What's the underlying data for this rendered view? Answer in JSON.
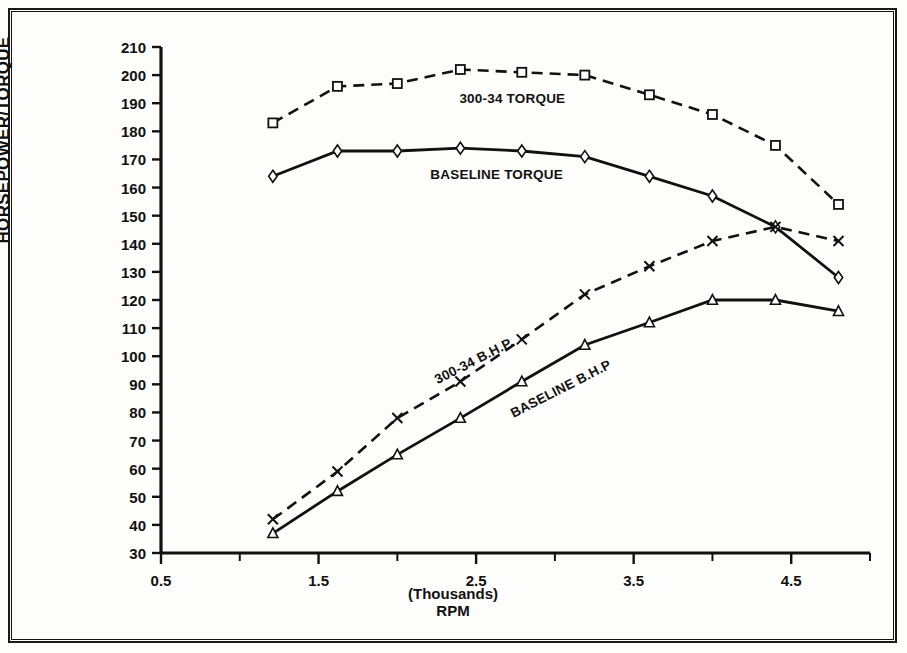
{
  "chart_data": {
    "type": "line",
    "title": "",
    "xlabel": "(Thousands) RPM",
    "ylabel": "HORSEPOWER/TORQUE",
    "xlabel_line1": "(Thousands)",
    "xlabel_line2": "RPM",
    "xlim": [
      0.5,
      5.0
    ],
    "ylim": [
      30,
      210
    ],
    "grid": false,
    "legend": "inline-annotations",
    "x_tick_labels": [
      "0.5",
      "1.5",
      "2.5",
      "3.5",
      "4.5"
    ],
    "x_tick_values": [
      0.5,
      1.5,
      2.5,
      3.5,
      4.5
    ],
    "x_minor_tick_values": [
      1.0,
      2.0,
      3.0,
      4.0,
      5.0
    ],
    "y_tick_labels": [
      "30",
      "40",
      "50",
      "60",
      "70",
      "80",
      "90",
      "100",
      "110",
      "120",
      "130",
      "140",
      "150",
      "160",
      "170",
      "180",
      "190",
      "200",
      "210"
    ],
    "y_tick_values": [
      30,
      40,
      50,
      60,
      70,
      80,
      90,
      100,
      110,
      120,
      130,
      140,
      150,
      160,
      170,
      180,
      190,
      200,
      210
    ],
    "x": [
      1.21,
      1.62,
      2.0,
      2.4,
      2.79,
      3.19,
      3.6,
      4.0,
      4.4,
      4.8
    ],
    "series": [
      {
        "name": "300-34 TORQUE",
        "marker": "square",
        "line_style": "dashed",
        "color": "#111111",
        "values": [
          183,
          196,
          197,
          202,
          201,
          200,
          193,
          186,
          175,
          154
        ],
        "label_x": 2.73,
        "label_y": 190
      },
      {
        "name": "BASELINE TORQUE",
        "marker": "diamond",
        "line_style": "solid",
        "color": "#111111",
        "values": [
          164,
          173,
          173,
          174,
          173,
          171,
          164,
          157,
          146,
          128
        ],
        "label_x": 2.63,
        "label_y": 163
      },
      {
        "name": "300-34 B.H.P.",
        "marker": "cross",
        "line_style": "dashed",
        "color": "#111111",
        "values": [
          42,
          59,
          78,
          91,
          106,
          122,
          132,
          141,
          146,
          141
        ],
        "label_x": 2.5,
        "label_y": 97,
        "label_rotation": -27
      },
      {
        "name": "BASELINE B.H.P",
        "marker": "triangle",
        "line_style": "solid",
        "color": "#111111",
        "values": [
          37,
          52,
          65,
          78,
          91,
          104,
          112,
          120,
          120,
          116
        ],
        "label_x": 3.05,
        "label_y": 87,
        "label_rotation": -27
      }
    ]
  },
  "figure": {
    "border_color": "#1a1a1a",
    "background": "#fdfdfb"
  }
}
